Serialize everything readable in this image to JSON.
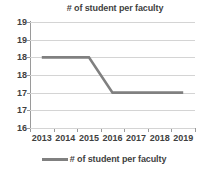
{
  "chart_data": {
    "type": "line",
    "title": "# of student per faculty",
    "xlabel": "",
    "ylabel": "",
    "categories": [
      "2013",
      "2014",
      "2015",
      "2016",
      "2017",
      "2018",
      "2019"
    ],
    "series": [
      {
        "name": "# of student per faculty",
        "values": [
          18,
          18,
          18,
          17,
          17,
          17,
          17
        ],
        "color": "#808080"
      }
    ],
    "ylim": [
      16,
      19
    ],
    "y_tick_values": [
      19,
      18.5,
      18,
      17.5,
      17,
      16.5,
      16
    ],
    "y_tick_labels": [
      "19",
      "19",
      "18",
      "18",
      "17",
      "17",
      "16"
    ],
    "grid": true,
    "grid_color": "#d4d4d4",
    "axis_color": "#9a9a9a",
    "legend": {
      "position": "bottom",
      "entries": [
        {
          "label": "# of student per faculty",
          "color": "#808080"
        }
      ]
    },
    "markers": false,
    "background": "#ffffff"
  }
}
